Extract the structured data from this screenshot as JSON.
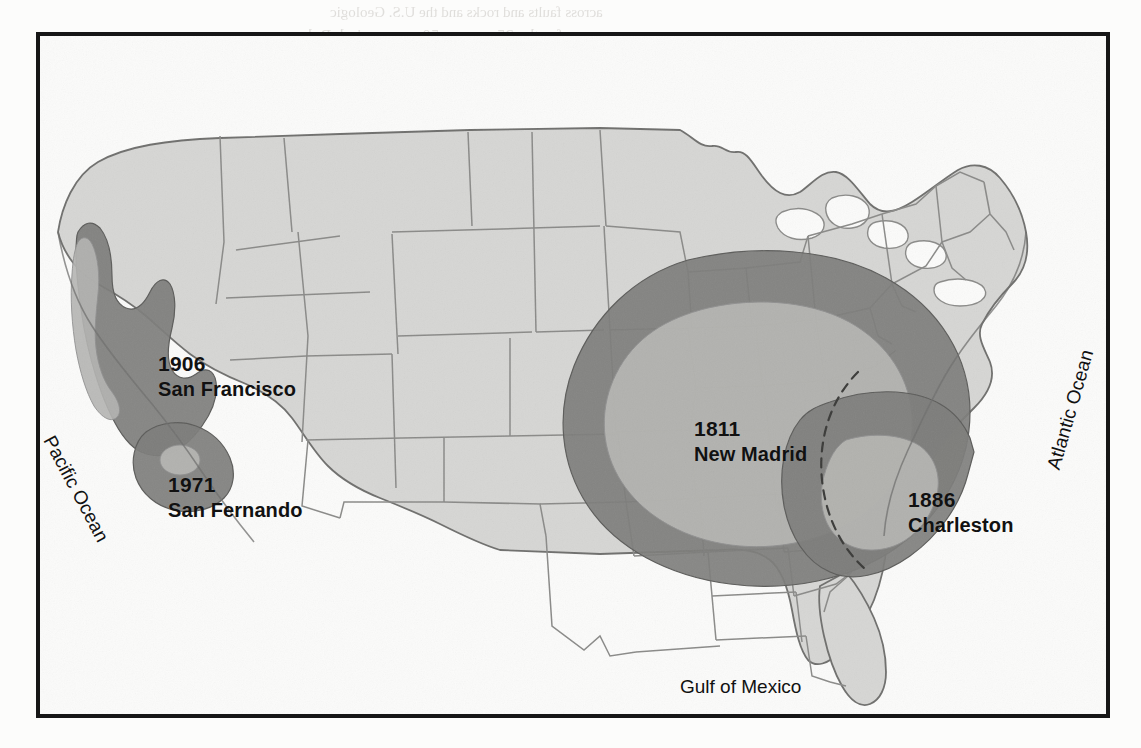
{
  "document": {
    "type": "scanned-textbook-page",
    "figure": {
      "title": "Map of the United States showing felt areas of major historic earthquakes",
      "frame": {
        "border_color": "#161616",
        "background": "#ffffff"
      }
    }
  },
  "map": {
    "base_land_color": "#d6d6d4",
    "ocean_color": "#fbfbfa",
    "state_border_color": "#8a8a88",
    "coastline_color": "#6f6f6d",
    "zone_outer_color": "#7d7d7b",
    "zone_inner_color": "#b4b4b1",
    "dashed_overlap_color": "#3a3a38",
    "legend_note": "Shaded concentric areas show the region over which each earthquake was felt; darker outer ring = felt area, lighter inner core = area of major damage."
  },
  "earthquake_labels": [
    {
      "id": "san-francisco",
      "year": "1906",
      "name": "San Francisco",
      "x": 118,
      "y": 315
    },
    {
      "id": "san-fernando",
      "year": "1971",
      "name": "San Fernando",
      "x": 128,
      "y": 436
    },
    {
      "id": "new-madrid",
      "year": "1811",
      "name": "New Madrid",
      "x": 654,
      "y": 380
    },
    {
      "id": "charleston",
      "year": "1886",
      "name": "Charleston",
      "x": 868,
      "y": 451
    }
  ],
  "water_labels": {
    "pacific": "Pacific Ocean",
    "atlantic": "Atlantic Ocean",
    "gulf": "Gulf of Mexico"
  },
  "background_ghost_text": {
    "note": "Faint mirrored bleed-through from the reverse side of the scanned page; not legible as content.",
    "lines": [
      {
        "text": "across faults and rocks and the U.S. Geologic",
        "x": 330,
        "y": 4,
        "size": 15
      },
      {
        "text": "for the 25-year or 50-year period. Rela",
        "x": 300,
        "y": 26,
        "size": 17
      },
      {
        "text": "tions",
        "x": 640,
        "y": 48,
        "size": 15
      },
      {
        "text": "the",
        "x": 120,
        "y": 120,
        "size": 15
      },
      {
        "text": "prob",
        "x": 820,
        "y": 150,
        "size": 15
      },
      {
        "text": "earth",
        "x": 70,
        "y": 210,
        "size": 15
      },
      {
        "text": "the",
        "x": 880,
        "y": 240,
        "size": 15
      },
      {
        "text": "of an",
        "x": 40,
        "y": 430,
        "size": 16
      },
      {
        "text": "states in the Mid",
        "x": 40,
        "y": 468,
        "size": 17
      },
      {
        "text": "west and coastal-plain and",
        "x": 40,
        "y": 506,
        "size": 17
      },
      {
        "text": "states, areas surrounding the Ne",
        "x": 40,
        "y": 544,
        "size": 17
      },
      {
        "text": "Mississippi embayment stand",
        "x": 40,
        "y": 580,
        "size": 17
      },
      {
        "text": "in contrast. Why are these soft-rock",
        "x": 40,
        "y": 616,
        "size": 17
      },
      {
        "text": "sites more vulnerable to ground motion?",
        "x": 40,
        "y": 652,
        "size": 17
      },
      {
        "text": "The distribution around the epicenter of the",
        "x": 40,
        "y": 690,
        "size": 17
      }
    ]
  }
}
